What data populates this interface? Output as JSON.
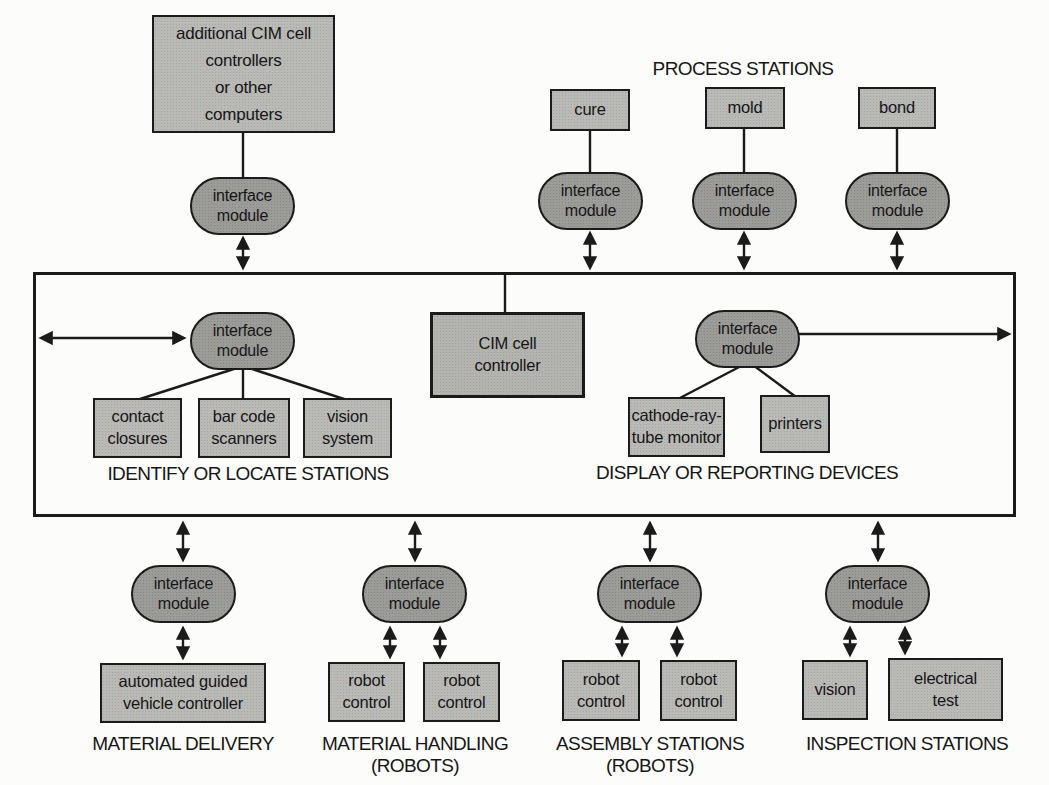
{
  "colors": {
    "box_fill": "#b9b9b6",
    "pill_fill": "#9b9b98",
    "cim_fill": "#b3b3b0",
    "line": "#1b1b1b",
    "paper": "#fcfcfa"
  },
  "pill_label": "interface\nmodule",
  "top": {
    "additional_box": "additional CIM cell\ncontrollers\nor other\ncomputers",
    "process_stations_label": "PROCESS STATIONS",
    "cure": "cure",
    "mold": "mold",
    "bond": "bond"
  },
  "bus": {
    "cim_controller": "CIM cell\ncontroller",
    "identify": {
      "label": "IDENTIFY OR LOCATE STATIONS",
      "contact": "contact\nclosures",
      "barcode": "bar code\nscanners",
      "vision": "vision\nsystem"
    },
    "display": {
      "label": "DISPLAY OR REPORTING DEVICES",
      "crt": "cathode-ray-\ntube monitor",
      "printers": "printers"
    }
  },
  "bottom": {
    "material_delivery": {
      "label": "MATERIAL DELIVERY",
      "agv": "automated guided\nvehicle controller"
    },
    "material_handling": {
      "label": "MATERIAL HANDLING",
      "sublabel": "(ROBOTS)",
      "robot": "robot\ncontrol"
    },
    "assembly": {
      "label": "ASSEMBLY STATIONS",
      "sublabel": "(ROBOTS)",
      "robot": "robot\ncontrol"
    },
    "inspection": {
      "label": "INSPECTION STATIONS",
      "vision": "vision",
      "electrical": "electrical\ntest"
    }
  }
}
